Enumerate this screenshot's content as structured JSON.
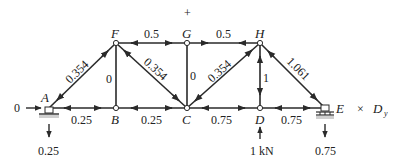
{
  "diagram": {
    "type": "truss-force-diagram",
    "sign_marker": "+",
    "nodes": [
      {
        "id": "A",
        "x": 49,
        "y": 108,
        "label": "A"
      },
      {
        "id": "B",
        "x": 116,
        "y": 108,
        "label": "B"
      },
      {
        "id": "C",
        "x": 187,
        "y": 108,
        "label": "C"
      },
      {
        "id": "D",
        "x": 260,
        "y": 108,
        "label": "D"
      },
      {
        "id": "E",
        "x": 325,
        "y": 108,
        "label": "E"
      },
      {
        "id": "F",
        "x": 116,
        "y": 43,
        "label": "F"
      },
      {
        "id": "G",
        "x": 187,
        "y": 43,
        "label": "G"
      },
      {
        "id": "H",
        "x": 260,
        "y": 43,
        "label": "H"
      }
    ],
    "members": [
      {
        "from": "A",
        "to": "B",
        "force": "0.25"
      },
      {
        "from": "B",
        "to": "C",
        "force": "0.25"
      },
      {
        "from": "C",
        "to": "D",
        "force": "0.75"
      },
      {
        "from": "D",
        "to": "E",
        "force": "0.75"
      },
      {
        "from": "F",
        "to": "G",
        "force": "0.5"
      },
      {
        "from": "G",
        "to": "H",
        "force": "0.5"
      },
      {
        "from": "A",
        "to": "F",
        "force": "0.354"
      },
      {
        "from": "F",
        "to": "C",
        "force": "0.354"
      },
      {
        "from": "C",
        "to": "H",
        "force": "0.354"
      },
      {
        "from": "H",
        "to": "E",
        "force": "1.061"
      },
      {
        "from": "F",
        "to": "B",
        "force": "0"
      },
      {
        "from": "G",
        "to": "C",
        "force": "0"
      },
      {
        "from": "H",
        "to": "D",
        "force": "1"
      }
    ],
    "loads": {
      "a_horizontal": "0",
      "a_reaction": "0.25",
      "d_load": "1 kN",
      "e_reaction": "0.75",
      "e_symbol": "×",
      "e_dy_label": "D",
      "e_dy_sub": "y"
    },
    "colors": {
      "line": "#2a2a2a",
      "support_fill": "#cfcfcf",
      "text": "#222222"
    }
  }
}
